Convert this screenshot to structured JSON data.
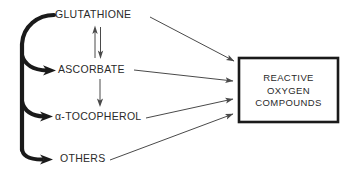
{
  "diagram": {
    "background_color": "#ffffff",
    "line_color": "#4a4a4a",
    "thick_line_color": "#1a1a1a",
    "text_color": "#2a2a2a",
    "nodes": [
      {
        "id": "glutathione",
        "label": "GLUTATHIONE",
        "x": 55,
        "y": 18
      },
      {
        "id": "ascorbate",
        "label": "ASCORBATE",
        "x": 58,
        "y": 73
      },
      {
        "id": "tocopherol",
        "label": "α-TOCOPHEROL",
        "x": 55,
        "y": 120
      },
      {
        "id": "others",
        "label": "OTHERS",
        "x": 60,
        "y": 162
      }
    ],
    "target_box": {
      "id": "reactive-oxygen-compounds",
      "lines": [
        "REACTIVE",
        "OXYGEN",
        "COMPOUNDS"
      ],
      "x": 239,
      "y": 58,
      "width": 99,
      "height": 64,
      "border_color": "#1a1a1a",
      "fill_color": "#ffffff"
    },
    "edges": [
      {
        "id": "glutathione-to-box",
        "from": "glutathione",
        "to": "reactive-oxygen-compounds",
        "style": "thin-arrow"
      },
      {
        "id": "ascorbate-to-box",
        "from": "ascorbate",
        "to": "reactive-oxygen-compounds",
        "style": "thin-arrow"
      },
      {
        "id": "tocopherol-to-box",
        "from": "tocopherol",
        "to": "reactive-oxygen-compounds",
        "style": "thin-arrow"
      },
      {
        "id": "others-to-box",
        "from": "others",
        "to": "reactive-oxygen-compounds",
        "style": "thin-arrow"
      },
      {
        "id": "glutathione-ascorbate-reversible",
        "from": "glutathione",
        "to": "ascorbate",
        "style": "thin-double-arrow-vertical"
      },
      {
        "id": "ascorbate-to-tocopherol",
        "from": "ascorbate",
        "to": "tocopherol",
        "style": "thin-arrow-vertical"
      },
      {
        "id": "glutathione-trunk-to-ascorbate",
        "from": "glutathione",
        "to": "ascorbate",
        "style": "thick-curved-arrow"
      },
      {
        "id": "glutathione-trunk-to-tocopherol",
        "from": "glutathione",
        "to": "tocopherol",
        "style": "thick-curved-arrow"
      },
      {
        "id": "glutathione-trunk-to-others",
        "from": "glutathione",
        "to": "others",
        "style": "thick-curved-arrow"
      }
    ]
  }
}
